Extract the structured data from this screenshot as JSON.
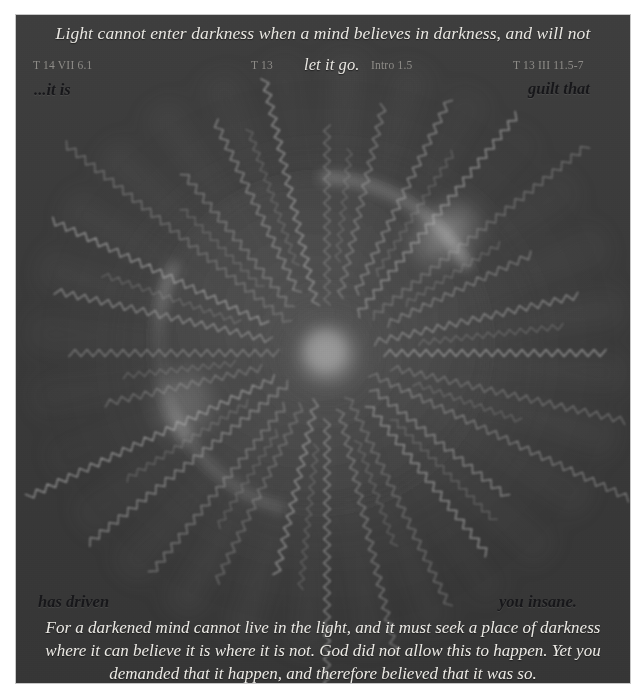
{
  "artwork": {
    "title": "radiant-sun-burst",
    "description": "Dark grey panel with a glowing central orb and zigzag rays radiating outward inside a large circular disc",
    "background_color": "#3a3a3a",
    "core_color": "#8a8a8a",
    "ray_color": "#b4b4b4",
    "ray_count": 28,
    "core_radius": 40,
    "disc_radius": 168,
    "center_x": 311,
    "center_y": 338
  },
  "top": {
    "quote": "Light cannot enter darkness when a mind believes in darkness, and will not",
    "quote_continuation": "let it go.",
    "citations": [
      "T 14 VII 6.1",
      "T 13",
      "Intro 1.5",
      "T 13 III 11.5-7"
    ],
    "phrase_left": "...it is",
    "phrase_right": "guilt that"
  },
  "bottom": {
    "phrase_left": "has driven",
    "phrase_right": "you insane.",
    "body_lines": [
      "For a darkened mind cannot live in the light, and it must seek a place of darkness",
      "where it can believe it is where it is not. God did not allow this to happen. Yet you",
      "demanded that it happen, and therefore believed that it was so."
    ]
  },
  "colors": {
    "panel": "#3a3a3a",
    "light_text": "#e9e7e2",
    "citation_text": "#8e8c88",
    "dark_text": "#17171a",
    "page": "#ffffff"
  }
}
